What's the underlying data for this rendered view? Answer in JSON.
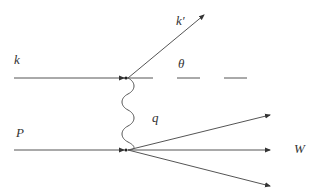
{
  "diagram": {
    "type": "feynman-diagram",
    "labels": {
      "incoming_lepton": "k",
      "outgoing_lepton": "k′",
      "angle": "θ",
      "proton": "P",
      "photon": "q",
      "hadronic_final_state": "W"
    },
    "colors": {
      "line": "#555555",
      "text": "#333333",
      "background": "#ffffff"
    }
  }
}
